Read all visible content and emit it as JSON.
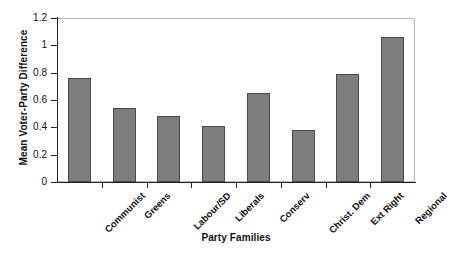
{
  "chart_data": {
    "type": "bar",
    "title": "",
    "xlabel": "Party Families",
    "ylabel": "Mean Voter-Party Difference",
    "categories": [
      "Communist",
      "Greens",
      "Labour/SD",
      "Liberals",
      "Conserv",
      "Christ. Dem",
      "Ext Right",
      "Regional"
    ],
    "values": [
      0.76,
      0.54,
      0.48,
      0.41,
      0.65,
      0.38,
      0.79,
      1.06
    ],
    "ylim": [
      0,
      1.2
    ],
    "yticks": [
      0,
      0.2,
      0.4,
      0.6,
      0.8,
      1,
      1.2
    ],
    "ytick_labels": [
      "0",
      "0.2",
      "0.4",
      "0.6",
      "0.8",
      "1",
      "1.2"
    ],
    "grid": false,
    "legend": false,
    "bar_color": "#7d7d7d",
    "bar_border_color": "#4a4a4a",
    "axis_color": "#222222",
    "frame_color": "#b9b9b9",
    "background": "#ffffff"
  }
}
